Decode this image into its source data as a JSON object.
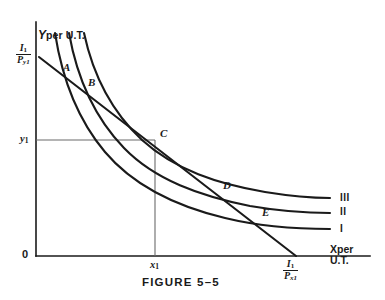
{
  "figure": {
    "caption": "FIGURE 5–5",
    "caption_x": 142,
    "caption_y": 277
  },
  "axes": {
    "y_axis_title_main": "Y",
    "y_axis_title_rest": "per U.T.",
    "x_axis_title_main": "X",
    "x_axis_title_rest": "per",
    "x_axis_title_line2": "U.T.",
    "origin_label": "0",
    "y_tick_label": "y",
    "y_tick_sub": "1",
    "x_tick_label": "x",
    "x_tick_sub": "1",
    "x_axis_y": 256,
    "y_axis_x": 36,
    "y_axis_top": 22,
    "x_axis_right": 370
  },
  "intercepts": {
    "y_intercept": {
      "numerator": "I",
      "numerator_sub": "1",
      "denominator": "P",
      "denominator_sub": "y1",
      "x": 16,
      "y": 48
    },
    "x_intercept": {
      "numerator": "I",
      "numerator_sub": "1",
      "denominator": "P",
      "denominator_sub": "x1",
      "x": 285,
      "y": 258
    }
  },
  "guides": {
    "y1_value": 140,
    "x1_value": 155
  },
  "points": [
    {
      "id": "A",
      "label": "A",
      "x": 62,
      "y": 73,
      "label_x": 63,
      "label_y": 62
    },
    {
      "id": "B",
      "label": "B",
      "x": 87,
      "y": 88,
      "label_x": 88,
      "label_y": 77
    },
    {
      "id": "C",
      "label": "C",
      "x": 155,
      "y": 140,
      "label_x": 160,
      "label_y": 128
    },
    {
      "id": "D",
      "label": "D",
      "x": 222,
      "y": 192,
      "label_x": 223,
      "label_y": 180
    },
    {
      "id": "E",
      "label": "E",
      "x": 262,
      "y": 219,
      "label_x": 262,
      "label_y": 207
    }
  ],
  "curves": [
    {
      "id": "I",
      "label": "I",
      "label_x": 340,
      "label_y": 224,
      "path": "M 55,33 C 62,78 78,120 105,152 C 132,184 175,206 225,218 C 262,227 300,229 330,229"
    },
    {
      "id": "II",
      "label": "II",
      "label_x": 340,
      "label_y": 207,
      "path": "M 69,33 C 77,78 95,118 124,148 C 155,180 200,196 250,206 C 285,212 312,213 330,213"
    },
    {
      "id": "III",
      "label": "III",
      "label_x": 340,
      "label_y": 193,
      "path": "M 84,33 C 93,75 112,112 142,140 C 175,170 218,184 265,192 C 296,197 316,198 330,198"
    }
  ],
  "budget_line": {
    "x1": 39,
    "y1": 57,
    "x2": 296,
    "y2": 256
  },
  "colors": {
    "ink": "#1a1a1a",
    "guide": "#6b6b6b",
    "background": "#ffffff"
  }
}
